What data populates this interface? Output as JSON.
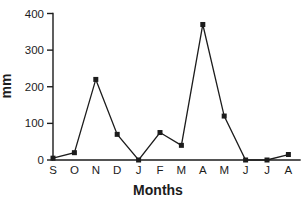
{
  "chart": {
    "background": "#ffffff",
    "ink": "#1c1c1c"
  },
  "chart_data": {
    "type": "line",
    "categories": [
      "S",
      "O",
      "N",
      "D",
      "J",
      "F",
      "M",
      "A",
      "M",
      "J",
      "J",
      "A"
    ],
    "values": [
      5,
      20,
      220,
      70,
      0,
      75,
      40,
      370,
      120,
      0,
      0,
      15
    ],
    "title": "",
    "xlabel": "Months",
    "ylabel": "mm",
    "yticks": [
      0,
      100,
      200,
      300,
      400
    ],
    "ylim": [
      0,
      400
    ],
    "grid": false,
    "legend": "none",
    "marker": "square",
    "line_color": "#1c1c1c",
    "marker_color": "#1c1c1c"
  }
}
